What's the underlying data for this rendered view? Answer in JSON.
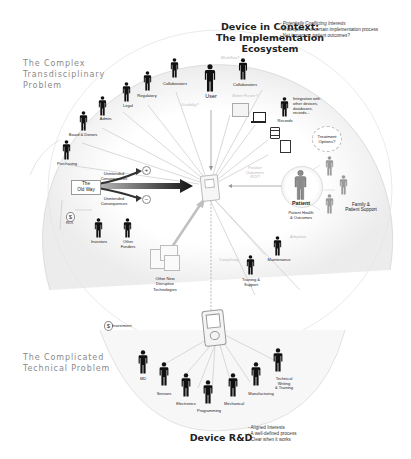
{
  "header": {
    "title_line1": "Device in Context:",
    "title_line2": "The Implementation Ecosystem",
    "bullets": [
      "- Potentially Conflicting Interests",
      "- A complex & uncertain implementation process",
      "- Net impact on patient outcomes?"
    ]
  },
  "side_titles": {
    "complex": [
      "The Complex",
      "Transdisciplinary",
      "Problem"
    ],
    "complicated": [
      "The Complicated",
      "Technical Problem"
    ]
  },
  "stakeholders_top": [
    {
      "label": "Collaborators"
    },
    {
      "label": "Regulatory"
    },
    {
      "label": "Legal"
    },
    {
      "label": "Admin."
    },
    {
      "label": "Board & Donors"
    },
    {
      "label": "Purchasing"
    }
  ],
  "user": {
    "label": "User",
    "note": "Usability?"
  },
  "collaborators_right": {
    "label": "Collaborators",
    "note": "Workflow?"
  },
  "better_faster": "Better Faster?",
  "records": {
    "label": "Records",
    "note": [
      "Integration with",
      "other devices,",
      "databases,",
      "records..."
    ]
  },
  "treatment": [
    "Treatment",
    "Options?"
  ],
  "patient": {
    "label": "Patient",
    "sub": [
      "Patient Health",
      "& Outcomes"
    ],
    "arrow_note": [
      "Positive",
      "Outcomes",
      "ROI?"
    ]
  },
  "family": [
    "Family &",
    "Patient Support"
  ],
  "old_way": {
    "label": [
      "The",
      "Old Way"
    ],
    "upper": [
      "Unintended",
      "Consequences"
    ],
    "lower": [
      "Unintended",
      "Consequences"
    ],
    "plus": "+",
    "minus": "−"
  },
  "roi": {
    "symbol": "$",
    "label": "ROI"
  },
  "investors": [
    {
      "label": "Investors"
    },
    {
      "label": [
        "Other",
        "Funders"
      ]
    }
  ],
  "disruptive": [
    "Other New",
    "Disruptive",
    "Technologies"
  ],
  "maintenance": {
    "label": "Maintenance",
    "note": "Adoption"
  },
  "training": {
    "label": [
      "Training &",
      "Support"
    ],
    "note": "Complexity"
  },
  "investment": {
    "symbol": "$",
    "label": "Investment"
  },
  "rd_team": [
    {
      "label": "MD"
    },
    {
      "label": "Sensors"
    },
    {
      "label": "Electronics"
    },
    {
      "label": "Programming"
    },
    {
      "label": "Mechanical"
    },
    {
      "label": "Manufacturing"
    },
    {
      "label": [
        "Technical",
        "Writing",
        "& Training"
      ]
    }
  ],
  "footer": {
    "title": "Device R&D",
    "bullets": [
      "- Aligned Interests",
      "- A well-defined process",
      "- Clear when it works"
    ]
  },
  "colors": {
    "person": "#111111",
    "person_gray": "#9a9a9a",
    "line": "#c8c8c8",
    "arc": "#e6e6e6"
  }
}
